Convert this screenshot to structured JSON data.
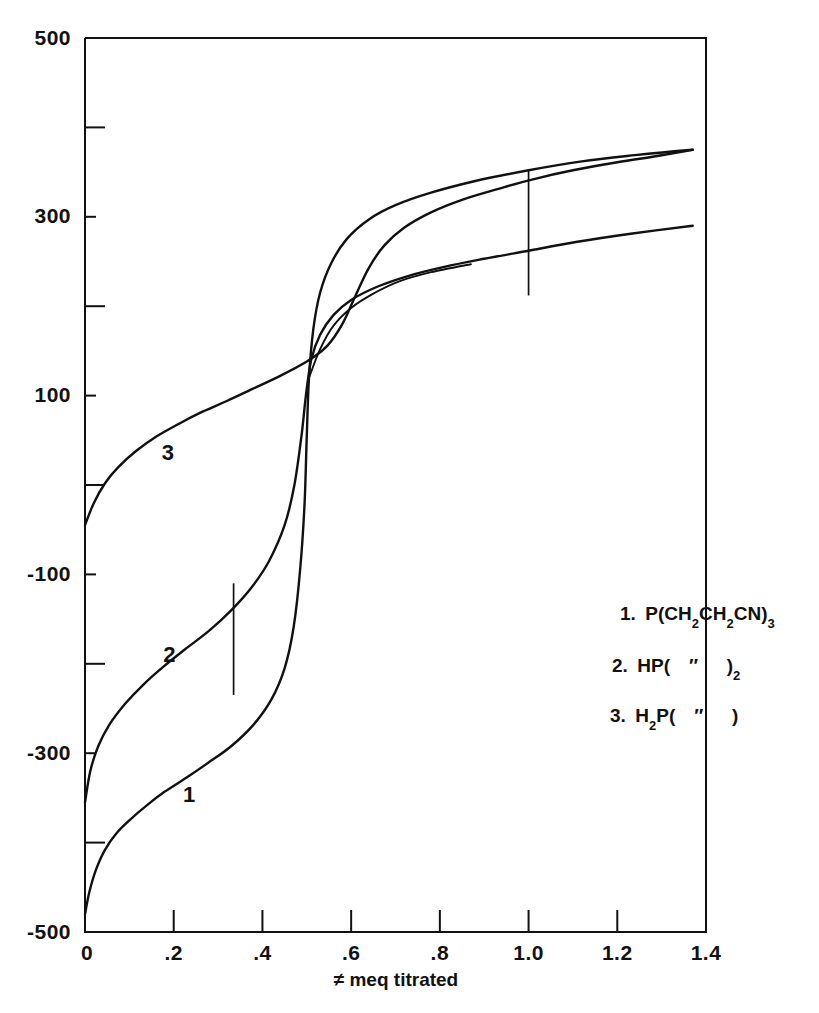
{
  "chart_data": {
    "type": "line",
    "title": "",
    "xlabel": "≠ meq titrated",
    "ylabel": "",
    "xlim": [
      0,
      1.4
    ],
    "ylim": [
      -500,
      500
    ],
    "grid": false,
    "legend_position": "inside-right",
    "xticks": [
      0,
      0.2,
      0.4,
      0.6,
      0.8,
      1.0,
      1.2,
      1.4
    ],
    "xticklabels": [
      "0",
      ".2",
      ".4",
      ".6",
      ".8",
      "1.0",
      "1.2",
      "1.4"
    ],
    "yticks": [
      -500,
      -400,
      -300,
      -200,
      -100,
      0,
      100,
      200,
      300,
      400,
      500
    ],
    "yticklabels": [
      "-500",
      "",
      "-300",
      "",
      "-100",
      "",
      "100",
      "",
      "300",
      "",
      "500"
    ],
    "ylabeled_ticks": [
      {
        "value": 500,
        "label": "500"
      },
      {
        "value": 300,
        "label": "300"
      },
      {
        "value": 100,
        "label": "100"
      },
      {
        "value": -100,
        "label": "-100"
      },
      {
        "value": -300,
        "label": "-300"
      },
      {
        "value": -500,
        "label": "-500"
      }
    ],
    "series": [
      {
        "name": "1",
        "label": "1",
        "label_point": [
          0.235,
          -355
        ],
        "points": [
          [
            0.0,
            -480
          ],
          [
            0.01,
            -455
          ],
          [
            0.025,
            -430
          ],
          [
            0.045,
            -408
          ],
          [
            0.07,
            -390
          ],
          [
            0.1,
            -375
          ],
          [
            0.14,
            -358
          ],
          [
            0.18,
            -343
          ],
          [
            0.23,
            -327
          ],
          [
            0.28,
            -310
          ],
          [
            0.33,
            -292
          ],
          [
            0.38,
            -268
          ],
          [
            0.42,
            -240
          ],
          [
            0.45,
            -205
          ],
          [
            0.47,
            -160
          ],
          [
            0.485,
            -95
          ],
          [
            0.495,
            -20
          ],
          [
            0.5,
            55
          ],
          [
            0.505,
            120
          ],
          [
            0.515,
            175
          ],
          [
            0.53,
            215
          ],
          [
            0.555,
            248
          ],
          [
            0.59,
            275
          ],
          [
            0.64,
            297
          ],
          [
            0.7,
            313
          ],
          [
            0.78,
            327
          ],
          [
            0.88,
            340
          ],
          [
            1.0,
            352
          ],
          [
            1.12,
            362
          ],
          [
            1.24,
            369
          ],
          [
            1.37,
            375
          ]
        ]
      },
      {
        "name": "2",
        "label": "2",
        "label_point": [
          0.19,
          -198
        ],
        "points": [
          [
            0.0,
            -355
          ],
          [
            0.012,
            -320
          ],
          [
            0.03,
            -292
          ],
          [
            0.055,
            -268
          ],
          [
            0.09,
            -245
          ],
          [
            0.13,
            -224
          ],
          [
            0.175,
            -204
          ],
          [
            0.225,
            -184
          ],
          [
            0.28,
            -163
          ],
          [
            0.33,
            -140
          ],
          [
            0.375,
            -115
          ],
          [
            0.415,
            -85
          ],
          [
            0.45,
            -45
          ],
          [
            0.472,
            0
          ],
          [
            0.488,
            55
          ],
          [
            0.498,
            100
          ],
          [
            0.51,
            140
          ],
          [
            0.53,
            168
          ],
          [
            0.56,
            190
          ],
          [
            0.6,
            207
          ],
          [
            0.66,
            222
          ],
          [
            0.73,
            234
          ],
          [
            0.81,
            244
          ],
          [
            0.9,
            253
          ],
          [
            1.0,
            262
          ],
          [
            1.11,
            272
          ],
          [
            1.23,
            281
          ],
          [
            1.37,
            290
          ]
        ]
      },
      {
        "name": "3",
        "label": "3",
        "label_point": [
          0.187,
          28
        ],
        "points": [
          [
            0.0,
            -45
          ],
          [
            0.02,
            -20
          ],
          [
            0.045,
            2
          ],
          [
            0.075,
            20
          ],
          [
            0.115,
            38
          ],
          [
            0.16,
            54
          ],
          [
            0.21,
            68
          ],
          [
            0.265,
            82
          ],
          [
            0.32,
            94
          ],
          [
            0.38,
            108
          ],
          [
            0.44,
            122
          ],
          [
            0.5,
            138
          ],
          [
            0.545,
            155
          ],
          [
            0.58,
            180
          ],
          [
            0.61,
            212
          ],
          [
            0.64,
            243
          ],
          [
            0.675,
            268
          ],
          [
            0.72,
            288
          ],
          [
            0.78,
            305
          ],
          [
            0.85,
            319
          ],
          [
            0.93,
            331
          ],
          [
            1.01,
            342
          ],
          [
            1.1,
            352
          ],
          [
            1.2,
            361
          ],
          [
            1.29,
            368
          ],
          [
            1.37,
            375
          ]
        ]
      },
      {
        "name": "3-branch",
        "label": "",
        "points": [
          [
            0.505,
            120
          ],
          [
            0.53,
            152
          ],
          [
            0.56,
            178
          ],
          [
            0.6,
            198
          ],
          [
            0.65,
            214
          ],
          [
            0.71,
            228
          ],
          [
            0.78,
            238
          ],
          [
            0.87,
            247
          ]
        ]
      }
    ],
    "endpoint_markers": [
      {
        "x": 0.335,
        "y_from": -110,
        "y_to": -235
      },
      {
        "x": 1.0,
        "y_from": 352,
        "y_to": 212
      }
    ],
    "legend": [
      {
        "index": "1.",
        "formula": "P(CH₂CH₂CN)₃",
        "parts": [
          {
            "t": "1.",
            "sub": false
          },
          {
            "t": " P(CH",
            "sub": false
          },
          {
            "t": "2",
            "sub": true
          },
          {
            "t": "CH",
            "sub": false
          },
          {
            "t": "2",
            "sub": true
          },
          {
            "t": "CN)",
            "sub": false
          },
          {
            "t": "3",
            "sub": true
          }
        ]
      },
      {
        "index": "2.",
        "formula": "HP( ″ )₂",
        "parts": [
          {
            "t": "2.",
            "sub": false
          },
          {
            "t": " HP(",
            "sub": false
          },
          {
            "t": " ″ ",
            "sub": false
          },
          {
            "t": " )",
            "sub": false
          },
          {
            "t": "2",
            "sub": true
          }
        ]
      },
      {
        "index": "3.",
        "formula": "H₂P( ″ )",
        "parts": [
          {
            "t": "3.",
            "sub": false
          },
          {
            "t": " H",
            "sub": false
          },
          {
            "t": "2",
            "sub": true
          },
          {
            "t": "P(",
            "sub": false
          },
          {
            "t": " ″ ",
            "sub": false
          },
          {
            "t": " )",
            "sub": false
          }
        ]
      }
    ],
    "colors": {
      "ink": "#111111",
      "background": "#ffffff"
    }
  }
}
